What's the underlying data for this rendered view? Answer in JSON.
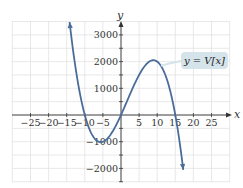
{
  "chart_data": {
    "type": "line",
    "title": "",
    "xlabel": "x",
    "ylabel": "y",
    "xlim": [
      -30,
      30
    ],
    "ylim": [
      -2500,
      3500
    ],
    "grid": true,
    "x_ticks": [
      -25,
      -20,
      -15,
      -10,
      -5,
      5,
      10,
      15,
      20,
      25
    ],
    "x_tick_labels": [
      "−25",
      "−20",
      "−15",
      "−10",
      "−5",
      "5",
      "10",
      "15",
      "20",
      "25"
    ],
    "y_ticks": [
      3000,
      2000,
      1000,
      -1000,
      -2000
    ],
    "y_tick_labels": [
      "3000",
      "2000",
      "1000",
      "−1000",
      "−2000"
    ],
    "series": [
      {
        "name": "y = V(x)",
        "formula": "V(x) = -2x(x+10)(x-15)",
        "x": [
          -14.2,
          -14,
          -13,
          -12,
          -11,
          -10,
          -9,
          -8,
          -7,
          -6,
          -5,
          -4,
          -3,
          -2,
          -1,
          0,
          1,
          2,
          3,
          4,
          5,
          6,
          7,
          8,
          9,
          10,
          11,
          12,
          13,
          14,
          15,
          16,
          17.2
        ],
        "values": [
          3296,
          3248,
          2496,
          1944,
          1144,
          0,
          -432,
          -644,
          -784,
          -756,
          -1000,
          -912,
          -756,
          -544,
          -288,
          0,
          616,
          624,
          864,
          1056,
          1500,
          1944,
          1904,
          2016,
          2052,
          2000,
          1848,
          1512,
          1196,
          672,
          0,
          -832,
          -2010
        ]
      }
    ],
    "annotations": [
      {
        "text": "y = V[x]",
        "near_x": 14,
        "near_y": 2000
      }
    ]
  },
  "labels": {
    "x_axis": "x",
    "y_axis": "y",
    "function": "y = V[x]"
  },
  "colors": {
    "curve": "#4a6c9b",
    "grid": "#e2e2e2",
    "axis": "#333333",
    "label_bg": "#d5e4ea"
  }
}
